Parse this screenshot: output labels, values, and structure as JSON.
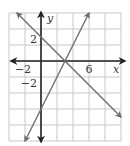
{
  "chart_data": {
    "type": "line",
    "title": "",
    "xlabel": "x",
    "ylabel": "y",
    "xlim": [
      -4,
      10
    ],
    "ylim": [
      -10,
      6
    ],
    "grid": true,
    "grid_step": 2,
    "x_tick_labels": [
      {
        "value": -2,
        "label": "−2"
      },
      {
        "value": 6,
        "label": "6"
      }
    ],
    "y_tick_labels": [
      {
        "value": 2,
        "label": "2"
      },
      {
        "value": -2,
        "label": "−2"
      }
    ],
    "series": [
      {
        "name": "line-decreasing",
        "equation": "y = -x + 3",
        "slope": -1,
        "intercept": 3,
        "x": [
          -3,
          10
        ],
        "y": [
          6,
          -7
        ]
      },
      {
        "name": "line-increasing",
        "equation": "y = 2x - 6",
        "slope": 2,
        "intercept": -6,
        "x": [
          -2,
          6
        ],
        "y": [
          -10,
          6
        ]
      }
    ],
    "intersection": {
      "x": 3,
      "y": 0
    }
  },
  "colors": {
    "grid": "#c8c8c8",
    "axes": "#222222",
    "lines": "#6e6e6e"
  }
}
